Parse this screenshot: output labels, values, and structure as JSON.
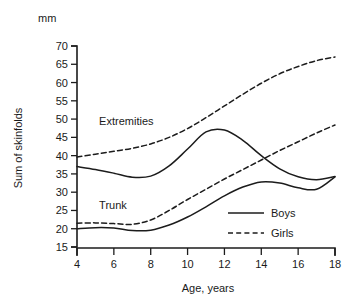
{
  "chart_data": {
    "type": "line",
    "title": "",
    "xlabel": "Age, years",
    "ylabel": "Sum of skinfolds",
    "unit_label": "mm",
    "xlim": [
      4,
      18
    ],
    "ylim": [
      15,
      70
    ],
    "xticks": [
      4,
      6,
      8,
      10,
      12,
      14,
      16,
      18
    ],
    "yticks": [
      15,
      20,
      25,
      30,
      35,
      40,
      45,
      50,
      55,
      60,
      65,
      70
    ],
    "grid": false,
    "legend_position": "inside-lower-right",
    "annotations": [
      {
        "text": "Extremities",
        "x": 5.2,
        "y": 48.5
      },
      {
        "text": "Trunk",
        "x": 5.2,
        "y": 25.5
      }
    ],
    "legend": [
      {
        "name": "Boys",
        "style": "solid"
      },
      {
        "name": "Girls",
        "style": "dashed"
      }
    ],
    "x": [
      4,
      5,
      6,
      7,
      8,
      9,
      10,
      11,
      12,
      13,
      14,
      15,
      16,
      17,
      18
    ],
    "series": [
      {
        "name": "Extremities, Boys",
        "group": "Extremities",
        "sex": "Boys",
        "style": "solid",
        "values": [
          37.0,
          36.2,
          35.2,
          34.1,
          34.4,
          37.2,
          41.8,
          46.5,
          47.0,
          44.2,
          40.0,
          36.4,
          34.2,
          33.4,
          34.3
        ]
      },
      {
        "name": "Extremities, Girls",
        "group": "Extremities",
        "sex": "Girls",
        "style": "dashed",
        "values": [
          39.6,
          40.4,
          41.2,
          42.0,
          43.2,
          45.0,
          47.4,
          50.4,
          53.6,
          56.8,
          59.8,
          62.4,
          64.4,
          66.0,
          67.0
        ]
      },
      {
        "name": "Trunk, Boys",
        "group": "Trunk",
        "sex": "Boys",
        "style": "solid",
        "values": [
          20.0,
          20.3,
          20.2,
          19.5,
          19.6,
          21.0,
          23.2,
          26.0,
          29.0,
          31.4,
          32.8,
          32.5,
          31.2,
          30.8,
          34.2
        ]
      },
      {
        "name": "Trunk, Girls",
        "group": "Trunk",
        "sex": "Girls",
        "style": "dashed",
        "values": [
          21.5,
          21.6,
          21.4,
          21.2,
          22.4,
          25.0,
          28.0,
          30.8,
          33.6,
          36.2,
          38.8,
          41.4,
          43.8,
          46.2,
          48.4
        ]
      }
    ]
  }
}
